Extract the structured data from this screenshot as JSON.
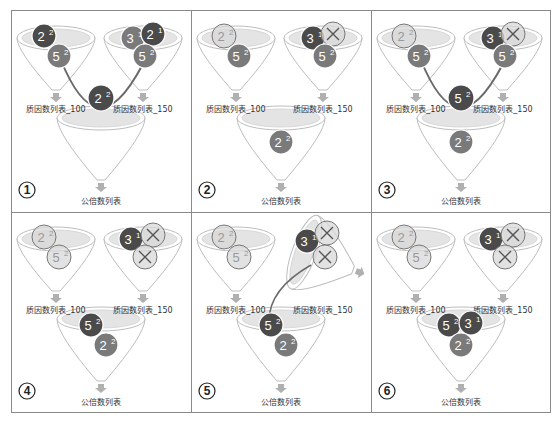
{
  "colors": {
    "ball_dark": "#4a4a4a",
    "ball_mid": "#7a7a7a",
    "ball_light": "#c8c8c8",
    "ball_ghost": "#d8d8d8",
    "funnel_stroke": "#bdbdbd",
    "funnel_fill": "#ffffff",
    "funnel_top": "#e4e4e4",
    "arrow": "#6a6a6a",
    "border": "#8a8a8a"
  },
  "labels": {
    "list100": "质因数列表_100",
    "list150": "质因数列表_150",
    "common": "公倍数列表"
  },
  "panels": [
    {
      "step": "1",
      "funnel_left": [
        {
          "base": "2",
          "exp": "2",
          "style": "dark",
          "dx": -12,
          "dy": -6
        },
        {
          "base": "5",
          "exp": "2",
          "style": "mid",
          "dx": 3,
          "dy": 14
        }
      ],
      "funnel_right": [
        {
          "base": "3",
          "exp": "1",
          "style": "mid",
          "dx": -10,
          "dy": -4
        },
        {
          "base": "2",
          "exp": "1",
          "style": "dark",
          "dx": 10,
          "dy": -8
        },
        {
          "base": "5",
          "exp": "2",
          "style": "mid",
          "dx": 2,
          "dy": 14
        }
      ],
      "funnel_bottom": [],
      "moving": {
        "base": "2",
        "exp": "2",
        "style": "dark"
      },
      "arrows": "converge"
    },
    {
      "step": "2",
      "funnel_left": [
        {
          "base": "2",
          "exp": "2",
          "style": "ghost",
          "dx": -12,
          "dy": -6
        },
        {
          "base": "5",
          "exp": "2",
          "style": "mid",
          "dx": 3,
          "dy": 14
        }
      ],
      "funnel_right": [
        {
          "base": "3",
          "exp": "1",
          "style": "dark",
          "dx": -10,
          "dy": -4
        },
        {
          "base": "×",
          "exp": "",
          "style": "ghost",
          "dx": 10,
          "dy": -8
        },
        {
          "base": "5",
          "exp": "2",
          "style": "mid",
          "dx": 2,
          "dy": 14
        }
      ],
      "funnel_bottom": [
        {
          "base": "2",
          "exp": "2",
          "style": "mid",
          "dx": 0,
          "dy": 16
        }
      ],
      "moving": null,
      "arrows": "none"
    },
    {
      "step": "3",
      "funnel_left": [
        {
          "base": "2",
          "exp": "2",
          "style": "ghost",
          "dx": -12,
          "dy": -6
        },
        {
          "base": "5",
          "exp": "2",
          "style": "mid",
          "dx": 3,
          "dy": 14
        }
      ],
      "funnel_right": [
        {
          "base": "3",
          "exp": "1",
          "style": "dark",
          "dx": -10,
          "dy": -4
        },
        {
          "base": "×",
          "exp": "",
          "style": "ghost",
          "dx": 10,
          "dy": -8
        },
        {
          "base": "5",
          "exp": "2",
          "style": "mid",
          "dx": 2,
          "dy": 14
        }
      ],
      "funnel_bottom": [
        {
          "base": "2",
          "exp": "2",
          "style": "mid",
          "dx": 0,
          "dy": 16
        }
      ],
      "moving": {
        "base": "5",
        "exp": "2",
        "style": "dark"
      },
      "arrows": "converge"
    },
    {
      "step": "4",
      "funnel_left": [
        {
          "base": "2",
          "exp": "2",
          "style": "ghost",
          "dx": -12,
          "dy": -6
        },
        {
          "base": "5",
          "exp": "2",
          "style": "ghost",
          "dx": 3,
          "dy": 14
        }
      ],
      "funnel_right": [
        {
          "base": "3",
          "exp": "1",
          "style": "dark",
          "dx": -12,
          "dy": -4
        },
        {
          "base": "×",
          "exp": "",
          "style": "ghost",
          "dx": 10,
          "dy": -8
        },
        {
          "base": "×",
          "exp": "",
          "style": "ghost",
          "dx": 2,
          "dy": 14
        }
      ],
      "funnel_bottom": [
        {
          "base": "5",
          "exp": "2",
          "style": "dark",
          "dx": -10,
          "dy": -2
        },
        {
          "base": "2",
          "exp": "2",
          "style": "mid",
          "dx": 5,
          "dy": 18
        }
      ],
      "moving": null,
      "arrows": "none"
    },
    {
      "step": "5",
      "funnel_left": [
        {
          "base": "2",
          "exp": "2",
          "style": "ghost",
          "dx": -12,
          "dy": -6
        },
        {
          "base": "5",
          "exp": "2",
          "style": "ghost",
          "dx": 3,
          "dy": 14
        }
      ],
      "funnel_right": [
        {
          "base": "3",
          "exp": "1",
          "style": "dark",
          "dx": -16,
          "dy": -2
        },
        {
          "base": "×",
          "exp": "",
          "style": "ghost",
          "dx": 4,
          "dy": -10
        },
        {
          "base": "×",
          "exp": "",
          "style": "ghost",
          "dx": 2,
          "dy": 14
        }
      ],
      "funnel_bottom": [
        {
          "base": "5",
          "exp": "2",
          "style": "dark",
          "dx": -10,
          "dy": -2
        },
        {
          "base": "2",
          "exp": "2",
          "style": "mid",
          "dx": 5,
          "dy": 18
        }
      ],
      "moving": null,
      "arrows": "pour",
      "tilted_right": true
    },
    {
      "step": "6",
      "funnel_left": [
        {
          "base": "2",
          "exp": "2",
          "style": "ghost",
          "dx": -12,
          "dy": -6
        },
        {
          "base": "5",
          "exp": "2",
          "style": "ghost",
          "dx": 3,
          "dy": 14
        }
      ],
      "funnel_right": [
        {
          "base": "3",
          "exp": "1",
          "style": "dark",
          "dx": -12,
          "dy": -4
        },
        {
          "base": "×",
          "exp": "",
          "style": "ghost",
          "dx": 10,
          "dy": -8
        },
        {
          "base": "×",
          "exp": "",
          "style": "ghost",
          "dx": 2,
          "dy": 14
        }
      ],
      "funnel_bottom": [
        {
          "base": "5",
          "exp": "2",
          "style": "dark",
          "dx": -12,
          "dy": -2
        },
        {
          "base": "3",
          "exp": "1",
          "style": "dark",
          "dx": 10,
          "dy": -4
        },
        {
          "base": "2",
          "exp": "2",
          "style": "mid",
          "dx": 0,
          "dy": 18
        }
      ],
      "moving": null,
      "arrows": "none"
    }
  ]
}
